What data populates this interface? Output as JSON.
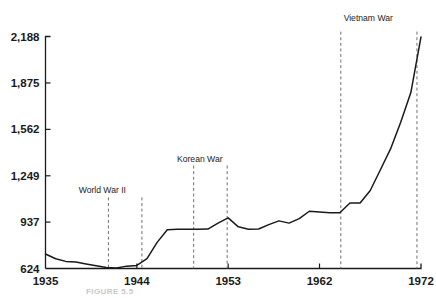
{
  "caption": "FIGURE 5.5",
  "chart_data": {
    "type": "line",
    "title": "",
    "subtitle": "",
    "xlabel": "",
    "ylabel": "",
    "grid": false,
    "legend": "none",
    "xlim": [
      1935,
      1972
    ],
    "ylim": [
      624,
      2188
    ],
    "xticks": [
      1935,
      1944,
      1953,
      1962,
      1972
    ],
    "xticklabels": [
      "1935",
      "1944",
      "1953",
      "1962",
      "1972"
    ],
    "yticks": [
      624,
      937,
      1249,
      1562,
      1875,
      2188
    ],
    "yticklabels": [
      "624",
      "937",
      "1,249",
      "1,562",
      "1,875",
      "2,188"
    ],
    "series": [
      {
        "name": "value",
        "x": [
          1935,
          1936,
          1937,
          1938,
          1939,
          1940,
          1941,
          1942,
          1943,
          1944,
          1945,
          1946,
          1947,
          1948,
          1949,
          1950,
          1951,
          1952,
          1953,
          1954,
          1955,
          1956,
          1957,
          1958,
          1959,
          1960,
          1961,
          1962,
          1963,
          1964,
          1965,
          1966,
          1967,
          1968,
          1969,
          1970,
          1971,
          1972
        ],
        "y": [
          722,
          690,
          672,
          668,
          655,
          642,
          630,
          628,
          640,
          645,
          690,
          800,
          885,
          888,
          888,
          888,
          890,
          930,
          965,
          905,
          888,
          890,
          920,
          945,
          930,
          960,
          1010,
          1005,
          1000,
          1000,
          1065,
          1065,
          1150,
          1290,
          1430,
          1610,
          1810,
          2185
        ]
      }
    ],
    "annotations": [
      {
        "label": "World War II",
        "label_x": 1940.6,
        "label_y": 1130,
        "markers": [
          1941.2,
          1944.5
        ]
      },
      {
        "label": "Korean War",
        "label_x": 1950.2,
        "label_y": 1345,
        "markers": [
          1949.6,
          1952.9
        ]
      },
      {
        "label": "Vietnam War",
        "label_x": 1966.8,
        "label_y": 2290,
        "markers": [
          1964.1,
          1971.6
        ]
      }
    ]
  }
}
